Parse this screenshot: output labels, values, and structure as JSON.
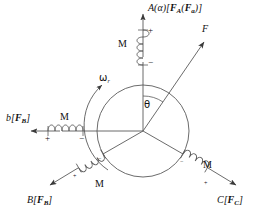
{
  "figure": {
    "type": "three-phase-winding-phasor-diagram",
    "background": "#ffffff",
    "stroke_color": "#444444",
    "text_color": "#111111",
    "center": {
      "x": 143,
      "y": 131
    },
    "circle_radius": 46
  },
  "axes": [
    {
      "id": "A",
      "label_main": "A",
      "label_paren": "(α)",
      "label_bracket_open": "[",
      "label_F": "F",
      "label_F_sub": "A",
      "label_inner_open": "(",
      "label_Fa": "F",
      "label_Fa_sub": "a",
      "label_inner_close": ")",
      "label_bracket_close": "]",
      "direction_deg": 90,
      "coil_label": "M",
      "sign_near": "+",
      "sign_far": "−"
    },
    {
      "id": "b",
      "label_main": "b",
      "label_bracket_open": "[",
      "label_F": "F",
      "label_F_sub": "B",
      "label_bracket_close": "]",
      "direction_deg": 180,
      "coil_label": "M",
      "sign_near": "+",
      "sign_far": "−"
    },
    {
      "id": "B",
      "label_main": "B",
      "label_bracket_open": "[",
      "label_F": "F",
      "label_F_sub": "B",
      "label_bracket_close": "]",
      "direction_deg": 210,
      "coil_label": "M",
      "sign_near": "+",
      "sign_far": "−"
    },
    {
      "id": "C",
      "label_main": "C",
      "label_bracket_open": "[",
      "label_F": "F",
      "label_F_sub": "C",
      "label_bracket_close": "]",
      "direction_deg": 330,
      "coil_label": "M",
      "sign_near": "+",
      "sign_far": "−"
    }
  ],
  "vectors": {
    "resultant": {
      "label": "F",
      "angle_from_vertical_deg": 35,
      "angle_label": "θ"
    },
    "rotation": {
      "label": "ω",
      "label_sub": "r",
      "sense": "counter-clockwise"
    }
  }
}
